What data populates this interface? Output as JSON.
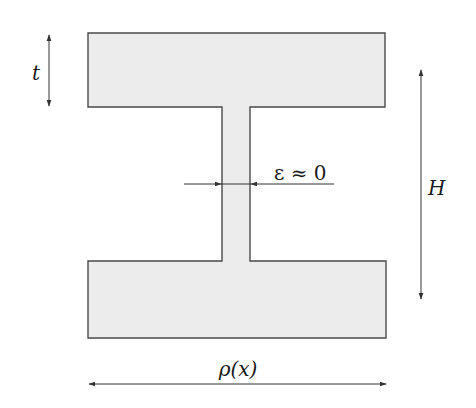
{
  "diagram": {
    "colors": {
      "fill": "#ececec",
      "stroke": "#4a4a4a",
      "arrow": "#333333",
      "text": "#1a1a1a"
    },
    "labels": {
      "flange_thickness": "t",
      "height": "H",
      "web_thickness": "ε ≈ 0",
      "width": "ρ(x)"
    },
    "geometry": {
      "top_flange": {
        "x": 88,
        "y": 33,
        "w": 297,
        "h": 74
      },
      "web": {
        "x": 222,
        "y": 107,
        "w": 28,
        "h": 154
      },
      "bottom_flange": {
        "x": 88,
        "y": 261,
        "w": 297,
        "h": 77
      }
    }
  }
}
